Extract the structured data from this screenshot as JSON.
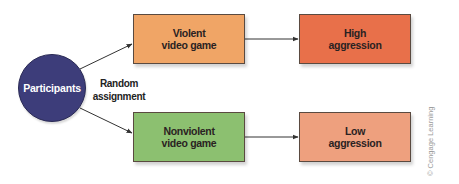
{
  "diagram": {
    "type": "flowchart",
    "colors": {
      "participants": "#3d3d7a",
      "violent": "#f0a566",
      "nonviolent": "#8cc070",
      "high": "#e8704a",
      "low": "#eea07e",
      "arrow": "#333333"
    },
    "nodes": {
      "participants": {
        "label": "Participants"
      },
      "violent": {
        "label": "Violent\nvideo game"
      },
      "nonviolent": {
        "label": "Nonviolent\nvideo game"
      },
      "high": {
        "label": "High\naggression"
      },
      "low": {
        "label": "Low\naggression"
      }
    },
    "edge_label": "Random\nassignment",
    "edges": [
      {
        "from": "participants",
        "to": "violent"
      },
      {
        "from": "participants",
        "to": "nonviolent"
      },
      {
        "from": "violent",
        "to": "high"
      },
      {
        "from": "nonviolent",
        "to": "low"
      }
    ],
    "credit": "© Cengage Learning"
  }
}
